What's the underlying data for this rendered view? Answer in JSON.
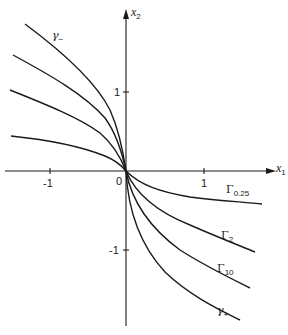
{
  "figure": {
    "type": "phase-portrait diagram",
    "axes": {
      "x": {
        "name": "x",
        "subscript": "1",
        "ticks": [
          "-1",
          "1"
        ]
      },
      "y": {
        "name": "x",
        "subscript": "2",
        "ticks": [
          "1",
          "-1"
        ]
      },
      "origin_label": "0"
    },
    "curves": [
      {
        "id": "gamma-minus",
        "label_base": "γ",
        "label_sub": "−"
      },
      {
        "id": "left-curve-2",
        "label_base": "",
        "label_sub": ""
      },
      {
        "id": "left-curve-3",
        "label_base": "",
        "label_sub": ""
      },
      {
        "id": "left-curve-4",
        "label_base": "",
        "label_sub": ""
      },
      {
        "id": "Gamma-0.25",
        "label_base": "Γ",
        "label_sub": "0.25"
      },
      {
        "id": "Gamma-2",
        "label_base": "Γ",
        "label_sub": "2"
      },
      {
        "id": "Gamma-10",
        "label_base": "Γ",
        "label_sub": "10"
      },
      {
        "id": "gamma-plus",
        "label_base": "γ",
        "label_sub": "+"
      }
    ],
    "colors": {
      "ink": "#1a1a1a",
      "background": "#ffffff"
    }
  }
}
